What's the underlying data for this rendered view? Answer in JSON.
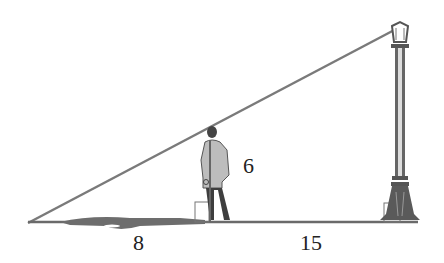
{
  "diagram": {
    "labels": {
      "person_height": "6",
      "shadow_length": "8",
      "distance_to_lamp": "15"
    },
    "colors": {
      "line": "#7a7a7a",
      "ground": "#6a6a6a",
      "figure": "#555555"
    }
  }
}
